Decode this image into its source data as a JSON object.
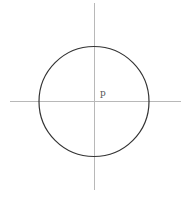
{
  "diagram": {
    "center_label": "p",
    "colors": {
      "background": "#ffffff",
      "axis": "#b8b8b8",
      "circle": "#333333",
      "label": "#555555"
    },
    "geometry": {
      "center": [
        94,
        101
      ],
      "radius": 55,
      "horizontal_axis": [
        10,
        181
      ],
      "vertical_axis": [
        3,
        190
      ]
    }
  }
}
